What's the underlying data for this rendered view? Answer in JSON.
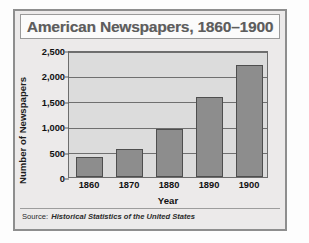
{
  "chart_data": {
    "type": "bar",
    "title": "American Newspapers, 1860–1900",
    "categories": [
      "1860",
      "1870",
      "1880",
      "1890",
      "1900"
    ],
    "values": [
      400,
      560,
      950,
      1570,
      2200
    ],
    "xlabel": "Year",
    "ylabel": "Number of Newspapers",
    "ylim": [
      0,
      2500
    ],
    "yticks": [
      0,
      500,
      1000,
      1500,
      2000,
      2500
    ],
    "ytick_labels": [
      "0",
      "500",
      "1,000",
      "1,500",
      "2,000",
      "2,500"
    ],
    "grid": true,
    "legend": false,
    "bar_color": "#8d8d8d",
    "bar_edge_color": "#4e4e4e",
    "plot_background": "#dcdcdc"
  },
  "source": {
    "label": "Source:",
    "text": "Historical Statistics of the United States"
  }
}
